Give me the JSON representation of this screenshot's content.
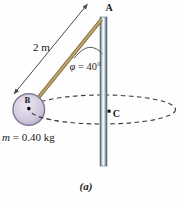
{
  "figure": {
    "caption": "(a)",
    "points": {
      "anchor": "A",
      "ball": "B",
      "center": "C"
    },
    "labels": {
      "length": "2 m",
      "angle_symbol": "φ",
      "angle_value": " = 40°",
      "mass_symbol": "m",
      "mass_value": " = 0.40 kg"
    },
    "values": {
      "string_length_m": 2,
      "angle_deg": 40,
      "mass_kg": 0.4
    },
    "colors": {
      "dash": "#3a3a3a",
      "dimension_line": "#4a4a4a",
      "rod_dark": "#54656f",
      "rod_mid": "#b9c7d1",
      "rod_highlight": "#ffffff",
      "string_core": "#c3aa6e",
      "string_edge": "#84703d",
      "ball_light": "#ece6f2",
      "ball_mid": "#d3cadd",
      "ball_dark": "#a89bb5",
      "ball_rim": "#837596",
      "text": "#1b1b22"
    }
  }
}
